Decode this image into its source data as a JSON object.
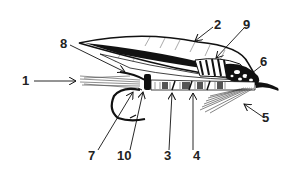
{
  "diagram": {
    "labels": [
      {
        "id": "1",
        "text": "1",
        "x": 25,
        "y": 85
      },
      {
        "id": "2",
        "text": "2",
        "x": 218,
        "y": 29
      },
      {
        "id": "3",
        "text": "3",
        "x": 167,
        "y": 159
      },
      {
        "id": "4",
        "text": "4",
        "x": 196,
        "y": 159
      },
      {
        "id": "5",
        "text": "5",
        "x": 266,
        "y": 123
      },
      {
        "id": "6",
        "text": "6",
        "x": 263,
        "y": 66
      },
      {
        "id": "7",
        "text": "7",
        "x": 91,
        "y": 159
      },
      {
        "id": "8",
        "text": "8",
        "x": 63,
        "y": 48
      },
      {
        "id": "9",
        "text": "9",
        "x": 246,
        "y": 29
      },
      {
        "id": "10",
        "text": "10",
        "x": 123,
        "y": 159
      }
    ],
    "colors": {
      "ink": "#111111",
      "background": "#ffffff",
      "label": "#222222"
    }
  }
}
